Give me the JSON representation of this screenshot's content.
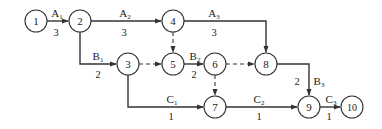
{
  "diagram": {
    "type": "activity-on-arrow network",
    "nodes": [
      {
        "id": "1",
        "label": "1",
        "x": 36,
        "y": 21
      },
      {
        "id": "2",
        "label": "2",
        "x": 80,
        "y": 21
      },
      {
        "id": "4",
        "label": "4",
        "x": 173,
        "y": 21
      },
      {
        "id": "3",
        "label": "3",
        "x": 128,
        "y": 64
      },
      {
        "id": "5",
        "label": "5",
        "x": 173,
        "y": 64
      },
      {
        "id": "6",
        "label": "6",
        "x": 215,
        "y": 64
      },
      {
        "id": "8",
        "label": "8",
        "x": 266,
        "y": 64
      },
      {
        "id": "7",
        "label": "7",
        "x": 215,
        "y": 107
      },
      {
        "id": "9",
        "label": "9",
        "x": 309,
        "y": 107
      },
      {
        "id": "10",
        "label": "10",
        "x": 352,
        "y": 107
      }
    ],
    "activities": [
      {
        "from": "1",
        "to": "2",
        "name": "A",
        "sub": "1",
        "duration": "3"
      },
      {
        "from": "2",
        "to": "4",
        "name": "A",
        "sub": "2",
        "duration": "3"
      },
      {
        "from": "4",
        "to": "8",
        "name": "A",
        "sub": "3",
        "duration": "3"
      },
      {
        "from": "2",
        "to": "3",
        "name": "B",
        "sub": "1",
        "duration": "2"
      },
      {
        "from": "5",
        "to": "6",
        "name": "B",
        "sub": "2",
        "duration": "2"
      },
      {
        "from": "8",
        "to": "9",
        "name": "B",
        "sub": "3",
        "duration": "2"
      },
      {
        "from": "3",
        "to": "7",
        "name": "C",
        "sub": "1",
        "duration": "1"
      },
      {
        "from": "7",
        "to": "9",
        "name": "C",
        "sub": "2",
        "duration": "1"
      },
      {
        "from": "9",
        "to": "10",
        "name": "C",
        "sub": "3",
        "duration": "1"
      }
    ],
    "dummy_activities": [
      {
        "from": "4",
        "to": "5"
      },
      {
        "from": "3",
        "to": "5"
      },
      {
        "from": "6",
        "to": "8"
      },
      {
        "from": "6",
        "to": "7"
      }
    ]
  },
  "labels": {
    "n1": "1",
    "n2": "2",
    "n3": "3",
    "n4": "4",
    "n5": "5",
    "n6": "6",
    "n7": "7",
    "n8": "8",
    "n9": "9",
    "n10": "10",
    "a1": {
      "name": "A",
      "sub": "1",
      "dur": "3"
    },
    "a2": {
      "name": "A",
      "sub": "2",
      "dur": "3"
    },
    "a3": {
      "name": "A",
      "sub": "3",
      "dur": "3"
    },
    "b1": {
      "name": "B",
      "sub": "1",
      "dur": "2"
    },
    "b2": {
      "name": "B",
      "sub": "2",
      "dur": "2"
    },
    "b3": {
      "name": "B",
      "sub": "3",
      "dur": "2"
    },
    "c1": {
      "name": "C",
      "sub": "1",
      "dur": "1"
    },
    "c2": {
      "name": "C",
      "sub": "2",
      "dur": "1"
    },
    "c3": {
      "name": "C",
      "sub": "3",
      "dur": "1"
    }
  }
}
